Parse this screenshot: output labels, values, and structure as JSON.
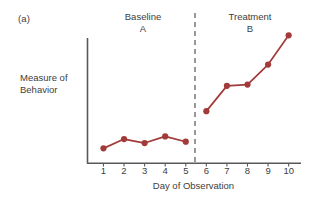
{
  "figure": {
    "panel_label": "(a)",
    "colors": {
      "series": "#A33A3A",
      "axis": "#585858",
      "divider": "#555555",
      "text": "#404040",
      "background": "#FFFFFF"
    }
  },
  "chart_data": {
    "type": "line",
    "title": "",
    "xlabel": "Day of Observation",
    "ylabel": "Measure of Behavior",
    "ylabel_lines": [
      "Measure of",
      "Behavior"
    ],
    "x": [
      1,
      2,
      3,
      4,
      5,
      6,
      7,
      8,
      9,
      10
    ],
    "xtick_labels": [
      "1",
      "2",
      "3",
      "4",
      "5",
      "6",
      "7",
      "8",
      "9",
      "10"
    ],
    "xlim": [
      0.2,
      10.6
    ],
    "ylim": [
      0,
      10
    ],
    "yticks": [],
    "ytick_labels": [],
    "grid": false,
    "legend": null,
    "series": [
      {
        "name": "Measure of Behavior",
        "color": "#A33A3A",
        "marker": "circle",
        "values": [
          1.1,
          1.8,
          1.5,
          2.0,
          1.6,
          3.9,
          5.8,
          5.9,
          7.4,
          9.6
        ],
        "segments": [
          {
            "phase": "A",
            "x": [
              1,
              2,
              3,
              4,
              5
            ],
            "values": [
              1.1,
              1.8,
              1.5,
              2.0,
              1.6
            ]
          },
          {
            "phase": "B",
            "x": [
              6,
              7,
              8,
              9,
              10
            ],
            "values": [
              3.9,
              5.8,
              5.9,
              7.4,
              9.6
            ]
          }
        ]
      }
    ],
    "phases": [
      {
        "id": "A",
        "name": "Baseline",
        "letter": "A",
        "x_range": [
          1,
          5
        ]
      },
      {
        "id": "B",
        "name": "Treatment",
        "letter": "B",
        "x_range": [
          6,
          10
        ]
      }
    ],
    "annotations": [
      {
        "type": "vertical-dashed-line",
        "x": 5.5,
        "label": "phase-change-line"
      }
    ]
  }
}
